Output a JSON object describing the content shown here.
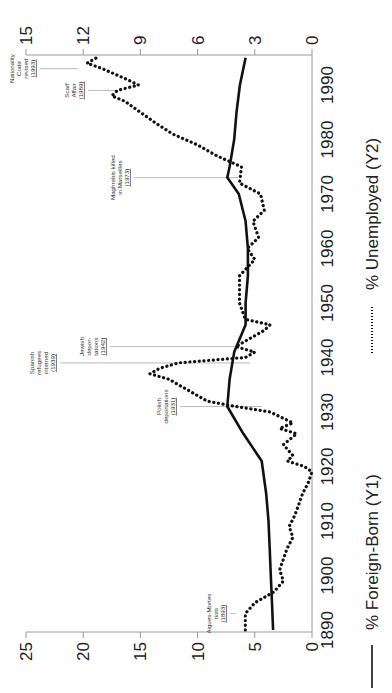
{
  "chart_data": {
    "type": "line",
    "orientation": "rotated-90-clockwise",
    "title": "",
    "xlabel": "Year",
    "x_ticks": [
      1890,
      1900,
      1910,
      1920,
      1930,
      1940,
      1950,
      1960,
      1970,
      1980,
      1990
    ],
    "xlim": [
      1890,
      1995
    ],
    "y1": {
      "label": "% Foreign-Born (Y1)",
      "ticks": [
        0,
        5,
        10,
        15,
        20,
        25
      ],
      "ylim": [
        0,
        25
      ]
    },
    "y2": {
      "label": "% Unemployed (Y2)",
      "ticks": [
        0,
        3,
        6,
        9,
        12,
        15
      ],
      "ylim": [
        0,
        15
      ]
    },
    "grid": false,
    "legend": [
      {
        "label": "% Foreign-Born (Y1)",
        "style": "solid"
      },
      {
        "label": "% Unemployed (Y2)",
        "style": "dotted"
      }
    ],
    "series": [
      {
        "name": "% Foreign-Born (Y1)",
        "axis": "y1",
        "style": "solid",
        "x": [
          1890,
          1895,
          1900,
          1905,
          1910,
          1915,
          1921,
          1926,
          1931,
          1936,
          1941,
          1946,
          1950,
          1955,
          1960,
          1965,
          1970,
          1973,
          1975,
          1980,
          1985,
          1990,
          1995
        ],
        "values": [
          3.4,
          3.5,
          3.6,
          3.7,
          3.8,
          4.0,
          4.4,
          6.0,
          7.4,
          7.2,
          6.8,
          5.8,
          5.8,
          5.6,
          5.6,
          5.8,
          6.4,
          7.4,
          7.2,
          6.8,
          6.6,
          6.3,
          5.8
        ]
      },
      {
        "name": "% Unemployed (Y2)",
        "axis": "y2",
        "style": "dotted",
        "x": [
          1890,
          1893,
          1895,
          1897,
          1899,
          1901,
          1903,
          1905,
          1907,
          1909,
          1911,
          1913,
          1915,
          1917,
          1919,
          1920,
          1921,
          1922,
          1924,
          1926,
          1927,
          1928,
          1930,
          1931,
          1932,
          1934,
          1935,
          1936,
          1937,
          1938,
          1939,
          1940,
          1941,
          1942,
          1943,
          1945,
          1946,
          1947,
          1950,
          1955,
          1958,
          1960,
          1962,
          1965,
          1967,
          1970,
          1972,
          1975,
          1977,
          1979,
          1981,
          1983,
          1985,
          1987,
          1988,
          1989,
          1990,
          1991,
          1993,
          1994,
          1995
        ],
        "values": [
          3.5,
          3.5,
          3.0,
          2.0,
          1.5,
          1.7,
          1.5,
          1.3,
          1.0,
          1.2,
          0.9,
          0.7,
          0.5,
          0.2,
          0.0,
          0.4,
          1.3,
          1.0,
          1.5,
          0.8,
          1.7,
          1.0,
          2.2,
          4.0,
          5.5,
          6.5,
          7.0,
          7.5,
          8.5,
          8.0,
          7.0,
          3.5,
          3.0,
          4.0,
          3.5,
          2.5,
          2.2,
          3.5,
          3.8,
          3.8,
          3.0,
          3.4,
          2.8,
          3.1,
          2.5,
          2.7,
          3.8,
          3.7,
          5.0,
          6.0,
          7.3,
          8.2,
          9.0,
          9.8,
          10.5,
          10.2,
          9.1,
          9.7,
          11.0,
          11.8,
          11.3
        ]
      }
    ],
    "annotations": [
      {
        "lines": [
          "Aigues-Mortes",
          "riots"
        ],
        "year_label": "(1893)",
        "year": 1893
      },
      {
        "lines": [
          "Polish",
          "deportations"
        ],
        "year_label": "(1931)",
        "year": 1931
      },
      {
        "lines": [
          "Spanish",
          "refugees",
          "interned"
        ],
        "year_label": "(1939)",
        "year": 1939
      },
      {
        "lines": [
          "Jewish",
          "depor-",
          "tations"
        ],
        "year_label": "(1942)",
        "year": 1942
      },
      {
        "lines": [
          "Maghrebis killed",
          "in Marseilles"
        ],
        "year_label": "(1973)",
        "year": 1973
      },
      {
        "lines": [
          "Scarf",
          "Affair"
        ],
        "year_label": "(1989)",
        "year": 1989
      },
      {
        "lines": [
          "Nationality",
          "Code",
          "revised"
        ],
        "year_label": "(1993)",
        "year": 1993
      }
    ]
  }
}
